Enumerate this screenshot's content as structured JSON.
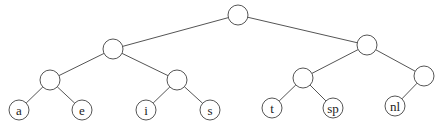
{
  "diagram": {
    "type": "binary-tree",
    "nodes": [
      {
        "id": "root",
        "x": 238,
        "y": 15,
        "r": 10,
        "label": ""
      },
      {
        "id": "n1",
        "x": 113,
        "y": 49,
        "r": 10,
        "label": ""
      },
      {
        "id": "n2",
        "x": 367,
        "y": 45,
        "r": 10,
        "label": ""
      },
      {
        "id": "n3",
        "x": 50,
        "y": 80,
        "r": 10,
        "label": ""
      },
      {
        "id": "n4",
        "x": 177,
        "y": 80,
        "r": 10,
        "label": ""
      },
      {
        "id": "n5",
        "x": 303,
        "y": 78,
        "r": 10,
        "label": ""
      },
      {
        "id": "n6",
        "x": 424,
        "y": 76,
        "r": 10,
        "label": ""
      },
      {
        "id": "leaf-a",
        "x": 19,
        "y": 110,
        "r": 10,
        "label": "a"
      },
      {
        "id": "leaf-e",
        "x": 82,
        "y": 110,
        "r": 10,
        "label": "e"
      },
      {
        "id": "leaf-i",
        "x": 146,
        "y": 110,
        "r": 10,
        "label": "i"
      },
      {
        "id": "leaf-s",
        "x": 210,
        "y": 110,
        "r": 10,
        "label": "s"
      },
      {
        "id": "leaf-t",
        "x": 272,
        "y": 108,
        "r": 10,
        "label": "t"
      },
      {
        "id": "leaf-sp",
        "x": 333,
        "y": 108,
        "r": 10,
        "label": "sp"
      },
      {
        "id": "leaf-nl",
        "x": 395,
        "y": 106,
        "r": 10,
        "label": "nl"
      }
    ],
    "edges": [
      [
        "root",
        "n1"
      ],
      [
        "root",
        "n2"
      ],
      [
        "n1",
        "n3"
      ],
      [
        "n1",
        "n4"
      ],
      [
        "n2",
        "n5"
      ],
      [
        "n2",
        "n6"
      ],
      [
        "n3",
        "leaf-a"
      ],
      [
        "n3",
        "leaf-e"
      ],
      [
        "n4",
        "leaf-i"
      ],
      [
        "n4",
        "leaf-s"
      ],
      [
        "n5",
        "leaf-t"
      ],
      [
        "n5",
        "leaf-sp"
      ],
      [
        "n6",
        "leaf-nl"
      ]
    ]
  }
}
